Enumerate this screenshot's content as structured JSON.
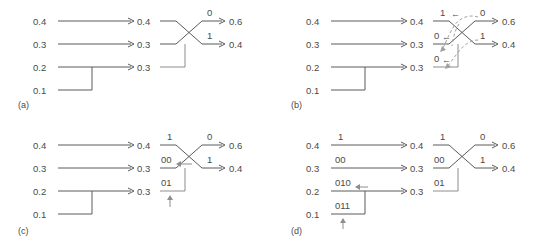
{
  "figure": {
    "type": "huffman-code-construction-diagram",
    "panels": [
      {
        "id": "a",
        "caption": "(a)",
        "stage1": [
          "0.4",
          "0.3",
          "0.2",
          "0.1"
        ],
        "stage2": [
          "0.4",
          "0.3",
          "0.3"
        ],
        "stage3": [
          "0.6",
          "0.4"
        ],
        "bit_labels_stage3": [
          "0",
          "1"
        ],
        "stage1_codes": [
          "",
          "",
          "",
          ""
        ],
        "stage2_codes": [
          "",
          "",
          ""
        ],
        "merge_arrow": "",
        "feedback_marks": []
      },
      {
        "id": "b",
        "caption": "(b)",
        "stage1": [
          "0.4",
          "0.3",
          "0.2",
          "0.1"
        ],
        "stage2": [
          "0.4",
          "0.3",
          "0.3"
        ],
        "stage3": [
          "0.6",
          "0.4"
        ],
        "bit_labels_stage3": [
          "0",
          "1"
        ],
        "stage2_codes": [
          "1",
          "0",
          "0"
        ],
        "dashed_labels": [
          "0",
          "1"
        ],
        "arrow_glyph": "←"
      },
      {
        "id": "c",
        "caption": "(c)",
        "stage1": [
          "0.4",
          "0.3",
          "0.2",
          "0.1"
        ],
        "stage2": [
          "0.4",
          "0.3",
          "0.3"
        ],
        "stage3": [
          "0.6",
          "0.4"
        ],
        "bit_labels_stage3": [
          "0",
          "1"
        ],
        "stage2_codes": [
          "1",
          "00",
          "01"
        ],
        "arrow_glyph": "←",
        "up_arrow_glyph": "↑"
      },
      {
        "id": "d",
        "caption": "(d)",
        "stage1": [
          "0.4",
          "0.3",
          "0.2",
          "0.1"
        ],
        "stage2": [
          "0.4",
          "0.3",
          "0.3"
        ],
        "stage3": [
          "0.6",
          "0.4"
        ],
        "bit_labels_stage3": [
          "0",
          "1"
        ],
        "stage1_codes": [
          "1",
          "00",
          "010",
          "011"
        ],
        "stage2_codes": [
          "1",
          "00",
          "01"
        ],
        "arrow_glyph": "←",
        "up_arrow_glyph": "↑"
      }
    ]
  },
  "colors": {
    "background": "#ffffff",
    "line": "#5a5a5a",
    "line_light": "#8d8d8d",
    "dashed": "#a0a0a0",
    "text": "#4a4a4a"
  }
}
